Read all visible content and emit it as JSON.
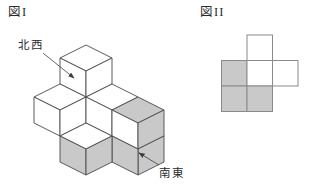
{
  "figure1": {
    "title": "図I",
    "labels": {
      "northwest": "北西",
      "southeast": "南東"
    },
    "colors": {
      "face_white": "#ffffff",
      "face_gray": "#c9c9c9",
      "line": "#4a4a4a"
    },
    "faces": [
      {
        "name": "top-cube-top",
        "points": "86,45 112,58 86,71 60,58",
        "shade": "w"
      },
      {
        "name": "top-cube-left",
        "points": "60,58 86,71 86,97 60,84",
        "shade": "w"
      },
      {
        "name": "top-cube-right",
        "points": "86,71 112,58 112,84 86,97",
        "shade": "w"
      },
      {
        "name": "west-cube-top",
        "points": "60,84 86,97 60,110 34,97",
        "shade": "w"
      },
      {
        "name": "west-cube-left",
        "points": "34,97 60,110 60,136 34,123",
        "shade": "w"
      },
      {
        "name": "west-cube-right",
        "points": "60,110 86,97 86,123 60,136",
        "shade": "w"
      },
      {
        "name": "mid-cube-top",
        "points": "112,84 138,97 112,110 86,97",
        "shade": "w"
      },
      {
        "name": "mid-cube-left",
        "points": "86,97 112,110 112,136 86,123",
        "shade": "w"
      },
      {
        "name": "east-cube-top",
        "points": "138,97 164,110 138,123 112,110",
        "shade": "g"
      },
      {
        "name": "east-cube-left",
        "points": "112,110 138,123 138,149 112,136",
        "shade": "w"
      },
      {
        "name": "east-cube-right",
        "points": "138,123 164,110 164,136 138,149",
        "shade": "g"
      },
      {
        "name": "east-lower-cube-right",
        "points": "138,149 164,136 164,162 138,175",
        "shade": "g"
      },
      {
        "name": "east-lower-cube-left",
        "points": "112,136 138,149 138,175 112,162",
        "shade": "g"
      },
      {
        "name": "front-cube-top",
        "points": "86,123 112,136 86,149 60,136",
        "shade": "w"
      },
      {
        "name": "front-cube-left",
        "points": "60,136 86,149 86,175 60,162",
        "shade": "g"
      },
      {
        "name": "front-cube-right",
        "points": "86,149 112,136 112,162 86,175",
        "shade": "g"
      }
    ],
    "arrows": [
      {
        "name": "northwest-arrow",
        "x1": 43,
        "y1": 53,
        "x2": 74,
        "y2": 78
      },
      {
        "name": "southeast-arrow",
        "x1": 159,
        "y1": 165,
        "x2": 139,
        "y2": 153
      }
    ]
  },
  "figure2": {
    "title": "図II",
    "grid": {
      "rows": 3,
      "cols": 3,
      "origin_x": 221.5,
      "origin_y": 35,
      "cell": 25.5,
      "cells": [
        [
          null,
          "w",
          null
        ],
        [
          "g",
          "w",
          "w"
        ],
        [
          "g",
          "g",
          null
        ]
      ]
    },
    "colors": {
      "white": "#ffffff",
      "gray": "#c9c9c9",
      "line": "#8a8a8a"
    }
  }
}
